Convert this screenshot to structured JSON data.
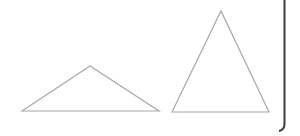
{
  "diagram": {
    "type": "geometric-shapes",
    "shapes": [
      {
        "name": "obtuse-triangle",
        "kind": "triangle",
        "description": "wide, flat triangle with obtuse apex angle"
      },
      {
        "name": "acute-triangle",
        "kind": "triangle",
        "description": "tall isosceles triangle with acute apex angle"
      }
    ],
    "frame": {
      "visible_edges": [
        "right",
        "bottom-right-corner"
      ]
    },
    "colors": {
      "shape_stroke": "#a8a8a8",
      "frame_stroke": "#3c3c3c",
      "background": "#ffffff"
    }
  }
}
